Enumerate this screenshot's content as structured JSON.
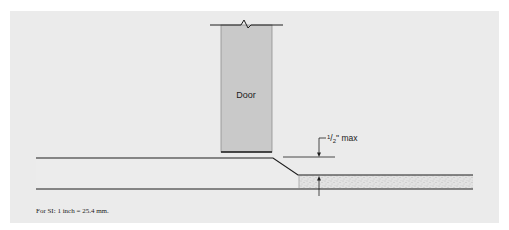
{
  "diagram": {
    "colors": {
      "background": "#ffffff",
      "panel": "#ebebeb",
      "door_fill": "#c9c9c9",
      "door_edge": "#8f8f8f",
      "line": "#1e1e1e",
      "floor_fill": "#ececec",
      "stipple_fill": "#e2e2e2",
      "stipple_dot": "#9a9a9a"
    },
    "door": {
      "label": "Door"
    },
    "dimension": {
      "numerator": "1",
      "denominator": "2",
      "unit_suffix": "\" max"
    },
    "footnote": "For SI: 1 inch = 25.4 mm."
  }
}
